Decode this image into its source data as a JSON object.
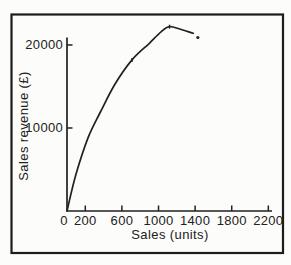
{
  "figure": {
    "background": "#fcfcfb",
    "border_color": "#1c1c1c",
    "ink_color": "#212121"
  },
  "chart_data": {
    "type": "line",
    "title": "",
    "xlabel": "Sales (units)",
    "ylabel": "Sales revenue (£)",
    "xlim": [
      0,
      2240
    ],
    "ylim": [
      0,
      20900
    ],
    "x_ticks": [
      200,
      600,
      1000,
      1400,
      1800,
      2200
    ],
    "x_origin_label": "0",
    "y_ticks": [
      10000,
      20000
    ],
    "grid": false,
    "legend": false,
    "series": [
      {
        "name": "Sales revenue",
        "color": "#212121",
        "points": [
          [
            0,
            0
          ],
          [
            100,
            4500
          ],
          [
            230,
            8800
          ],
          [
            360,
            11800
          ],
          [
            520,
            15200
          ],
          [
            710,
            18200
          ],
          [
            900,
            20200
          ],
          [
            1030,
            21600
          ],
          [
            1120,
            22200
          ],
          [
            1240,
            21900
          ],
          [
            1380,
            21400
          ]
        ]
      }
    ],
    "point_markers": [
      [
        710,
        18200
      ],
      [
        1120,
        22200
      ]
    ],
    "isolated_point": [
      1430,
      20900
    ]
  }
}
